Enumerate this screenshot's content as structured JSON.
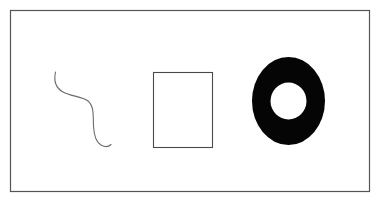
{
  "figure": {
    "name": "three-shapes-figure",
    "width": 380,
    "height": 206,
    "background_color": "#ffffff",
    "frame": {
      "name": "panel-border",
      "x": 10.5,
      "y": 10.5,
      "width": 359,
      "height": 181,
      "stroke_color": "#555555",
      "stroke_width": 1.2,
      "fill": "none"
    },
    "shapes": [
      {
        "name": "squiggle-curve",
        "kind": "open-curve",
        "label": "S-shaped curve",
        "stroke_color": "#6b6b6b",
        "stroke_width": 1.1,
        "fill": "none",
        "path": "M 55.5 72 C 53.5 81 56 88 63 92 C 70.5 96.5 82 96 88 101 C 94.5 106.5 93 117 93.5 126 C 94 135 95.5 142 101 145 C 105.5 147.5 109 146.5 111 144.5",
        "bbox": {
          "x": 53,
          "y": 72,
          "width": 58,
          "height": 76
        }
      },
      {
        "name": "empty-rectangle",
        "kind": "rectangle",
        "label": "Unfilled rectangle",
        "stroke_color": "#4a4a4a",
        "stroke_width": 1.1,
        "fill": "none",
        "x": 153.5,
        "y": 72.5,
        "width": 59,
        "height": 75,
        "bbox": {
          "x": 153,
          "y": 72,
          "width": 60,
          "height": 76
        }
      },
      {
        "name": "solid-ring",
        "kind": "annulus",
        "label": "Filled ring / donut",
        "fill_color": "#050505",
        "hole_color": "#ffffff",
        "center_x": 288.5,
        "center_y": 101,
        "outer_radius_x": 36.5,
        "outer_radius_y": 44,
        "inner_radius_x": 18,
        "inner_radius_y": 18.5,
        "bbox": {
          "x": 252,
          "y": 57,
          "width": 73,
          "height": 88
        }
      }
    ]
  }
}
